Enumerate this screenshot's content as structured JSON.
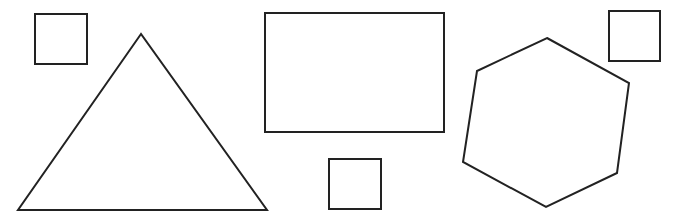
{
  "canvas": {
    "width": 674,
    "height": 224,
    "background": "#ffffff",
    "stroke": "#222222"
  },
  "shapes": [
    {
      "id": "square-top-left",
      "type": "square",
      "x": 35,
      "y": 14,
      "w": 52,
      "h": 50
    },
    {
      "id": "triangle",
      "type": "triangle",
      "points": "141,34 18,210 267,210"
    },
    {
      "id": "rectangle",
      "type": "rectangle",
      "x": 265,
      "y": 13,
      "w": 179,
      "h": 119
    },
    {
      "id": "square-bottom-middle",
      "type": "square",
      "x": 329,
      "y": 159,
      "w": 52,
      "h": 50
    },
    {
      "id": "hexagon",
      "type": "hexagon",
      "points": "547,38 629,83 617,173 546,207 463,162 477,71"
    },
    {
      "id": "square-top-right",
      "type": "square",
      "x": 609,
      "y": 11,
      "w": 51,
      "h": 50
    }
  ]
}
